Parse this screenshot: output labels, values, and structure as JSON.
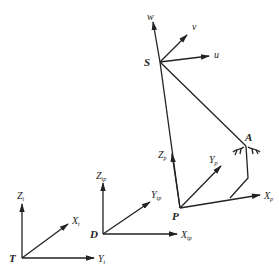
{
  "diagram": {
    "type": "coordinate-frames-kinematic-diagram",
    "points": {
      "S": {
        "label": "S",
        "x": 160,
        "y": 62
      },
      "A": {
        "label": "A",
        "x": 246,
        "y": 146
      },
      "P": {
        "label": "P",
        "x": 180,
        "y": 208
      },
      "D": {
        "label": "D",
        "x": 102,
        "y": 234
      },
      "T": {
        "label": "T",
        "x": 23,
        "y": 258
      }
    },
    "frames": [
      {
        "id": "S",
        "origin": "S",
        "axes": [
          {
            "name": "w",
            "label": "w",
            "sub": ""
          },
          {
            "name": "v",
            "label": "v",
            "sub": ""
          },
          {
            "name": "u",
            "label": "u",
            "sub": ""
          }
        ]
      },
      {
        "id": "P",
        "origin": "P",
        "axes": [
          {
            "name": "Zp",
            "label": "Z",
            "sub": "p"
          },
          {
            "name": "Yp",
            "label": "Y",
            "sub": "p"
          },
          {
            "name": "Xp",
            "label": "X",
            "sub": "p"
          }
        ]
      },
      {
        "id": "D",
        "origin": "D",
        "axes": [
          {
            "name": "Ztp",
            "label": "Z",
            "sub": "tp"
          },
          {
            "name": "Ytp",
            "label": "Y",
            "sub": "tp"
          },
          {
            "name": "Xtp",
            "label": "X",
            "sub": "tp"
          }
        ]
      },
      {
        "id": "T",
        "origin": "T",
        "axes": [
          {
            "name": "Zt",
            "label": "Z",
            "sub": "t"
          },
          {
            "name": "Xt",
            "label": "X",
            "sub": "t"
          },
          {
            "name": "Yt",
            "label": "Y",
            "sub": "t"
          }
        ]
      }
    ],
    "links": [
      {
        "from": "S",
        "to": "P"
      },
      {
        "from": "S",
        "to": "A"
      },
      {
        "from": "A",
        "to": "mount",
        "note": "vertical link from A down to bracket"
      },
      {
        "from": "mount",
        "to": "Xp-axis",
        "note": "bracket meeting Xp axis"
      }
    ],
    "ground_mark": {
      "at": "A",
      "style": "hatched-contact"
    }
  },
  "labels": {
    "S": "S",
    "A": "A",
    "P": "P",
    "D": "D",
    "T": "T",
    "w": "w",
    "v": "v",
    "u": "u",
    "Zp": "Z",
    "Zp_sub": "p",
    "Yp": "Y",
    "Yp_sub": "p",
    "Xp": "X",
    "Xp_sub": "p",
    "Ztp": "Z",
    "Ztp_sub": "tp",
    "Ytp": "Y",
    "Ytp_sub": "tp",
    "Xtp": "X",
    "Xtp_sub": "tp",
    "Zt": "Z",
    "Zt_sub": "t",
    "Xt": "X",
    "Xt_sub": "t",
    "Yt": "Y",
    "Yt_sub": "t"
  }
}
